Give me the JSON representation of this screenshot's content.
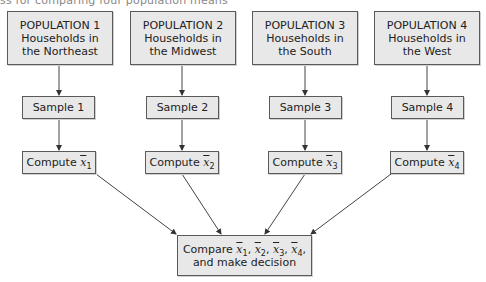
{
  "caption": "ss for comparing four population means",
  "populations": [
    {
      "title": "POPULATION 1",
      "line1": "Households in",
      "line2": "the Northeast"
    },
    {
      "title": "POPULATION 2",
      "line1": "Households in",
      "line2": "the Midwest"
    },
    {
      "title": "POPULATION 3",
      "line1": "Households in",
      "line2": "the South"
    },
    {
      "title": "POPULATION 4",
      "line1": "Households in",
      "line2": "the West"
    }
  ],
  "samples": [
    "Sample 1",
    "Sample 2",
    "Sample 3",
    "Sample 4"
  ],
  "computes": [
    {
      "label": "Compute",
      "var": "x",
      "sub": "1"
    },
    {
      "label": "Compute",
      "var": "x",
      "sub": "2"
    },
    {
      "label": "Compute",
      "var": "x",
      "sub": "3"
    },
    {
      "label": "Compute",
      "var": "x",
      "sub": "4"
    }
  ],
  "compare": {
    "label": "Compare",
    "vars": [
      {
        "var": "x",
        "sub": "1"
      },
      {
        "var": "x",
        "sub": "2"
      },
      {
        "var": "x",
        "sub": "3"
      },
      {
        "var": "x",
        "sub": "4"
      }
    ],
    "line2": "and make decision"
  },
  "colors": {
    "box_fill": "#e8e8e8",
    "box_border": "#5a5a5a",
    "line": "#444444"
  }
}
